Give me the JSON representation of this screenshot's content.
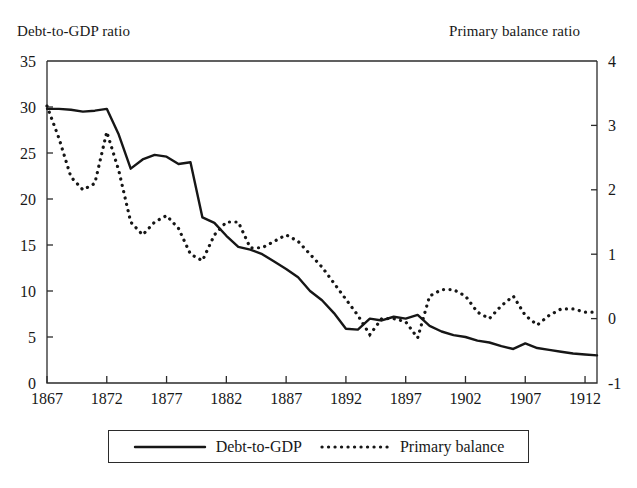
{
  "chart_data": {
    "type": "line",
    "title": "",
    "xlabel": "",
    "ylabel": "Debt-to-GDP ratio",
    "y2label": "Primary balance ratio",
    "grid": false,
    "legend_position": "bottom",
    "xlim": [
      1867,
      1913
    ],
    "ylim": [
      0,
      35
    ],
    "y2lim": [
      -1,
      4
    ],
    "xticks": [
      1867,
      1872,
      1877,
      1882,
      1887,
      1892,
      1897,
      1902,
      1907,
      1912
    ],
    "yticks": [
      0,
      5,
      10,
      15,
      20,
      25,
      30,
      35
    ],
    "y2ticks": [
      -1,
      0,
      1,
      2,
      3,
      4
    ],
    "x": [
      1867,
      1868,
      1869,
      1870,
      1871,
      1872,
      1873,
      1874,
      1875,
      1876,
      1877,
      1878,
      1879,
      1880,
      1881,
      1882,
      1883,
      1884,
      1885,
      1886,
      1887,
      1888,
      1889,
      1890,
      1891,
      1892,
      1893,
      1894,
      1895,
      1896,
      1897,
      1898,
      1899,
      1900,
      1901,
      1902,
      1903,
      1904,
      1905,
      1906,
      1907,
      1908,
      1909,
      1910,
      1911,
      1912,
      1913
    ],
    "series": [
      {
        "name": "Debt-to-GDP",
        "axis": "left",
        "style": "solid",
        "values": [
          29.8,
          29.8,
          29.7,
          29.5,
          29.6,
          29.8,
          27.0,
          23.3,
          24.3,
          24.8,
          24.6,
          23.8,
          24.0,
          18.0,
          17.4,
          16.0,
          14.8,
          14.5,
          14.0,
          13.2,
          12.4,
          11.5,
          10.0,
          9.0,
          7.6,
          5.9,
          5.8,
          7.0,
          6.8,
          7.2,
          7.0,
          7.4,
          6.2,
          5.6,
          5.2,
          5.0,
          4.6,
          4.4,
          4.0,
          3.7,
          4.3,
          3.8,
          3.6,
          3.4,
          3.2,
          3.1,
          3.0
        ]
      },
      {
        "name": "Primary balance",
        "axis": "right",
        "style": "dotted",
        "values": [
          3.3,
          2.8,
          2.2,
          2.0,
          2.1,
          2.9,
          2.3,
          1.5,
          1.3,
          1.5,
          1.6,
          1.4,
          1.0,
          0.9,
          1.3,
          1.5,
          1.5,
          1.1,
          1.1,
          1.2,
          1.3,
          1.2,
          1.0,
          0.8,
          0.55,
          0.3,
          0.05,
          -0.25,
          0.0,
          0.0,
          -0.05,
          -0.3,
          0.35,
          0.45,
          0.45,
          0.35,
          0.1,
          0.0,
          0.2,
          0.35,
          0.05,
          -0.1,
          0.05,
          0.15,
          0.15,
          0.1,
          0.1
        ]
      }
    ]
  },
  "axes": {
    "left_title": "Debt-to-GDP ratio",
    "right_title": "Primary balance ratio"
  },
  "legend": {
    "entries": [
      {
        "label": "Debt-to-GDP",
        "style": "solid"
      },
      {
        "label": "Primary balance",
        "style": "dotted"
      }
    ]
  },
  "colors": {
    "line": "#161616",
    "axis": "#2b2b2b",
    "background": "#ffffff"
  }
}
